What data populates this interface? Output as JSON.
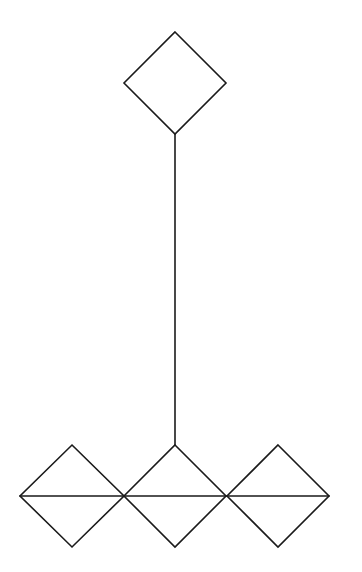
{
  "diagram": {
    "stroke_color": "#1a1a1a",
    "background_color": "#ffffff",
    "nodes": [
      {
        "id": "top-diamond",
        "shape": "diamond",
        "cx": 175,
        "cy": 83,
        "half_w": 51,
        "half_h": 51
      },
      {
        "id": "bottom-left-diamond",
        "shape": "diamond",
        "cx": 72,
        "cy": 496,
        "half_w": 52,
        "half_h": 51
      },
      {
        "id": "bottom-middle-diamond",
        "shape": "diamond",
        "cx": 175,
        "cy": 496,
        "half_w": 51,
        "half_h": 51
      },
      {
        "id": "bottom-right-diamond",
        "shape": "diamond",
        "cx": 278,
        "cy": 496,
        "half_w": 51,
        "half_h": 51
      }
    ],
    "edges": [
      {
        "id": "connector",
        "from": "top-diamond",
        "to": "bottom-middle-diamond",
        "x1": 175,
        "y1": 134,
        "x2": 175,
        "y2": 445
      },
      {
        "id": "bisector",
        "x1": 20,
        "y1": 496,
        "x2": 329,
        "y2": 496
      }
    ]
  }
}
